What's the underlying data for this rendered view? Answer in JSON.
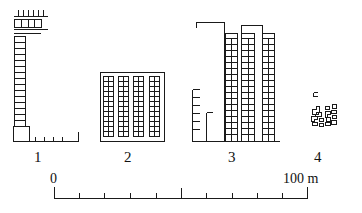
{
  "figure": {
    "kind": "architectural-elevation-diagram",
    "background_color": "#ffffff",
    "line_color": "#1a1a1a",
    "width": 362,
    "height": 213
  },
  "buildings": [
    {
      "id": "building-1",
      "label": "1",
      "label_x": 38,
      "label_y": 158,
      "description": "Tall narrow slab tower with ribbon of small square windows, wide low roof canopy with chimneys, low annex wall at right"
    },
    {
      "id": "building-2",
      "label": "2",
      "label_x": 128,
      "label_y": 158,
      "description": "Mid-rise block with four vertical window-strip bays under a flat roof slab"
    },
    {
      "id": "building-3",
      "label": "3",
      "label_x": 232,
      "label_y": 158,
      "description": "Stepped complex: blank tall wall at left with stair markings, three high window-strip towers at right"
    },
    {
      "id": "building-4",
      "label": "4",
      "label_x": 318,
      "label_y": 158,
      "description": "Cluster of very small low-rise footprints at diagram scale"
    }
  ],
  "scale": {
    "start_label": "0",
    "end_label": "100 m",
    "start_label_x": 51,
    "start_label_y": 176,
    "end_label_x": 287,
    "end_label_y": 176,
    "bar_x0": 54,
    "bar_x1": 307,
    "bar_y": 198,
    "major_ticks": [
      0,
      50,
      100
    ],
    "minor_ticks": [
      10,
      20,
      30,
      40,
      60,
      70,
      80,
      90
    ],
    "units": "m"
  }
}
